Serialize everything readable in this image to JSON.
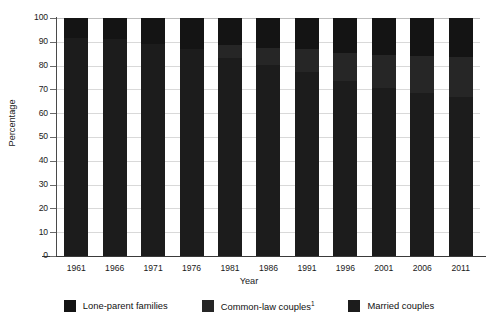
{
  "chart_data": {
    "type": "bar",
    "subtype": "stacked-100-percent",
    "title": "",
    "xlabel": "Year",
    "ylabel": "Percentage",
    "ylim": [
      0,
      100
    ],
    "ytick_step": 10,
    "yticks": [
      100,
      90,
      80,
      70,
      60,
      50,
      40,
      30,
      20,
      10,
      0
    ],
    "ytick_labels": [
      "100",
      "90",
      "80",
      "70",
      "60",
      "50",
      "40",
      "30",
      "20",
      "10",
      "0"
    ],
    "grid": true,
    "grid_axis": "y",
    "legend_position": "bottom",
    "categories": [
      "1961",
      "1966",
      "1971",
      "1976",
      "1981",
      "1986",
      "1991",
      "1996",
      "2001",
      "2006",
      "2011"
    ],
    "series": [
      {
        "name": "Married couples",
        "color": "#1c1c1c",
        "values": [
          91.6,
          91.0,
          88.9,
          87.1,
          83.1,
          80.2,
          77.2,
          73.7,
          70.5,
          68.6,
          67.0
        ]
      },
      {
        "name": "Common-law couples",
        "color": "#262626",
        "values": [
          0.0,
          0.0,
          0.0,
          0.0,
          5.6,
          7.2,
          9.9,
          11.7,
          13.8,
          15.5,
          16.7
        ]
      },
      {
        "name": "Lone-parent families",
        "color": "#141414",
        "values": [
          8.4,
          9.0,
          11.1,
          12.9,
          11.3,
          12.6,
          12.9,
          14.6,
          15.7,
          15.9,
          16.3
        ]
      }
    ],
    "stack_order_top_to_bottom": [
      "Lone-parent families",
      "Common-law couples",
      "Married couples"
    ]
  },
  "axes": {
    "y_title": "Percentage",
    "x_title": "Year"
  },
  "legend": {
    "items": [
      {
        "label": "Lone-parent families",
        "footnote": "",
        "color": "#141414"
      },
      {
        "label": "Common-law couples",
        "footnote": "1",
        "color": "#262626"
      },
      {
        "label": "Married couples",
        "footnote": "",
        "color": "#1c1c1c"
      }
    ]
  },
  "colors": {
    "background": "#ffffff",
    "grid": "#d9d9d9",
    "axis": "#3a3a3a",
    "text": "#1a1a1a"
  }
}
